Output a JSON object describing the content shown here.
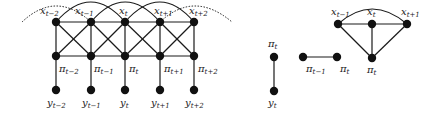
{
  "diagram": {
    "type": "graphical-model",
    "main_graph": {
      "nodes_x": [
        {
          "id": "x_t-2",
          "sym": "x",
          "sub": "t−2",
          "cx": 56,
          "cy": 22
        },
        {
          "id": "x_t-1",
          "sym": "x",
          "sub": "t−1",
          "cx": 91,
          "cy": 22
        },
        {
          "id": "x_t",
          "sym": "x",
          "sub": "t",
          "cx": 125,
          "cy": 22
        },
        {
          "id": "x_t+1",
          "sym": "x",
          "sub": "t+1",
          "cx": 160,
          "cy": 22
        },
        {
          "id": "x_t+2",
          "sym": "x",
          "sub": "t+2",
          "cx": 194,
          "cy": 22
        }
      ],
      "nodes_pi": [
        {
          "id": "pi_t-2",
          "sym": "π",
          "sub": "t−2",
          "cx": 56,
          "cy": 56
        },
        {
          "id": "pi_t-1",
          "sym": "π",
          "sub": "t−1",
          "cx": 91,
          "cy": 56
        },
        {
          "id": "pi_t",
          "sym": "π",
          "sub": "t",
          "cx": 125,
          "cy": 56
        },
        {
          "id": "pi_t+1",
          "sym": "π",
          "sub": "t+1",
          "cx": 160,
          "cy": 56
        },
        {
          "id": "pi_t+2",
          "sym": "π",
          "sub": "t+2",
          "cx": 194,
          "cy": 56
        }
      ],
      "nodes_y": [
        {
          "id": "y_t-2",
          "sym": "y",
          "sub": "t−2",
          "cx": 56,
          "cy": 90
        },
        {
          "id": "y_t-1",
          "sym": "y",
          "sub": "t−1",
          "cx": 91,
          "cy": 90
        },
        {
          "id": "y_t",
          "sym": "y",
          "sub": "t",
          "cx": 125,
          "cy": 90
        },
        {
          "id": "y_t+1",
          "sym": "y",
          "sub": "t+1",
          "cx": 160,
          "cy": 90
        },
        {
          "id": "y_t+2",
          "sym": "y",
          "sub": "t+2",
          "cx": 194,
          "cy": 90
        }
      ]
    },
    "clique_1": {
      "nodes": [
        {
          "id": "pi_t",
          "sym": "π",
          "sub": "t",
          "cx": 274,
          "cy": 57
        },
        {
          "id": "y_t",
          "sym": "y",
          "sub": "t",
          "cx": 274,
          "cy": 91
        }
      ]
    },
    "clique_2": {
      "nodes": [
        {
          "id": "pi_t-1",
          "sym": "π",
          "sub": "t−1",
          "cx": 303,
          "cy": 57
        },
        {
          "id": "pi_t",
          "sym": "π",
          "sub": "t",
          "cx": 337,
          "cy": 57
        }
      ]
    },
    "clique_3": {
      "nodes": [
        {
          "id": "x_t-1",
          "sym": "x",
          "sub": "t−1",
          "cx": 338,
          "cy": 24
        },
        {
          "id": "x_t",
          "sym": "x",
          "sub": "t",
          "cx": 372,
          "cy": 24
        },
        {
          "id": "x_t+1",
          "sym": "x",
          "sub": "t+1",
          "cx": 407,
          "cy": 24
        },
        {
          "id": "pi_t",
          "sym": "π",
          "sub": "t",
          "cx": 372,
          "cy": 58
        }
      ]
    },
    "colors": {
      "ink": "#1a1a1a",
      "node": "#111111",
      "background": "#ffffff"
    }
  }
}
